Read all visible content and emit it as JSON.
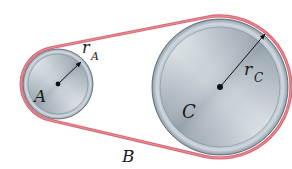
{
  "diagram": {
    "colors": {
      "belt": "#d96a76",
      "belt_highlight": "#eea3aa",
      "disc_light": "#e6ecf0",
      "disc_mid": "#a9b6bf",
      "disc_dark": "#6f7f8b",
      "rim": "#bcc8d0",
      "outline": "#55636e",
      "ink": "#1a1a1a"
    },
    "pulley_a": {
      "label": "A",
      "radius_label": "r",
      "radius_subscript": "A",
      "center": [
        58,
        84
      ],
      "radius": 35
    },
    "pulley_c": {
      "label": "C",
      "radius_label": "r",
      "radius_subscript": "C",
      "center": [
        220,
        87
      ],
      "radius": 68
    },
    "belt": {
      "label": "B"
    }
  }
}
